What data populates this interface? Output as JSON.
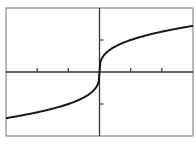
{
  "chart_data": {
    "type": "line",
    "title": "",
    "xlabel": "",
    "ylabel": "",
    "function": "y = cbrt(x)",
    "xlim": [
      -3,
      3
    ],
    "ylim": [
      -2,
      2
    ],
    "x_ticks": [
      -2,
      -1,
      1,
      2
    ],
    "y_ticks": [
      -1,
      1
    ],
    "tick_labels_shown": false,
    "grid": false,
    "legend": "none",
    "series": [
      {
        "name": "cube-root curve",
        "color": "#1a1a1a",
        "x": [
          -3,
          -2.5,
          -2,
          -1.5,
          -1,
          -0.5,
          -0.25,
          -0.1,
          -0.02,
          0,
          0.02,
          0.1,
          0.25,
          0.5,
          1,
          1.5,
          2,
          2.5,
          3
        ],
        "y": [
          -1.442,
          -1.357,
          -1.26,
          -1.145,
          -1,
          -0.794,
          -0.63,
          -0.464,
          -0.271,
          0,
          0.271,
          0.464,
          0.63,
          0.794,
          1,
          1.145,
          1.26,
          1.357,
          1.442
        ]
      }
    ],
    "colors": {
      "frame": "#8a8a8a",
      "axes": "#333333",
      "curve": "#1a1a1a"
    }
  }
}
